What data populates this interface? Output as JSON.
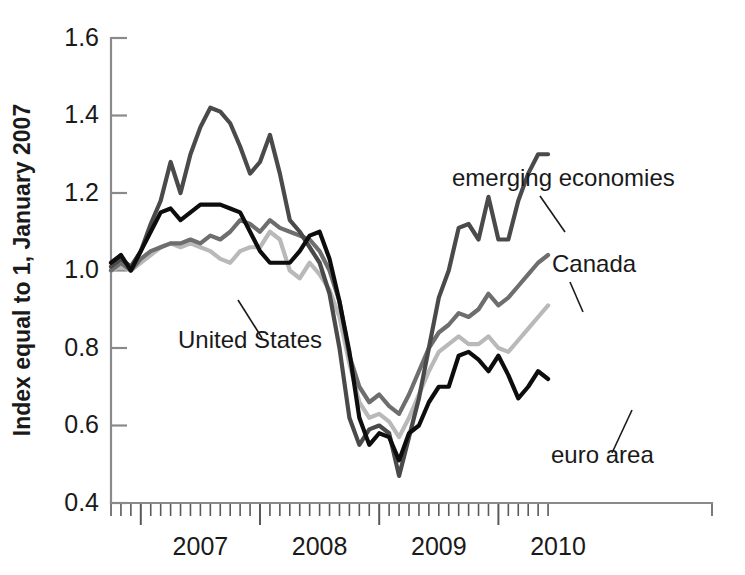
{
  "chart_data": {
    "type": "line",
    "title": "",
    "subtitle": "",
    "xlabel": "",
    "ylabel": "Index equal to 1, January 2007",
    "ylim": [
      0.4,
      1.6
    ],
    "yticks": [
      0.4,
      0.6,
      0.8,
      1.0,
      1.2,
      1.4,
      1.6
    ],
    "ytick_labels": [
      "0.4",
      "0.6",
      "0.8",
      "1.0",
      "1.2",
      "1.4",
      "1.6"
    ],
    "xlim": [
      "2006-10",
      "2010-07"
    ],
    "xticks": [
      "2007",
      "2008",
      "2009",
      "2010"
    ],
    "xtick_labels": [
      "2007",
      "2008",
      "2009",
      "2010"
    ],
    "x_minor_ticks": "monthly",
    "grid": false,
    "legend_position": "inline-annotations",
    "x": [
      "2006-10",
      "2006-11",
      "2006-12",
      "2007-01",
      "2007-02",
      "2007-03",
      "2007-04",
      "2007-05",
      "2007-06",
      "2007-07",
      "2007-08",
      "2007-09",
      "2007-10",
      "2007-11",
      "2007-12",
      "2008-01",
      "2008-02",
      "2008-03",
      "2008-04",
      "2008-05",
      "2008-06",
      "2008-07",
      "2008-08",
      "2008-09",
      "2008-10",
      "2008-11",
      "2008-12",
      "2009-01",
      "2009-02",
      "2009-03",
      "2009-04",
      "2009-05",
      "2009-06",
      "2009-07",
      "2009-08",
      "2009-09",
      "2009-10",
      "2009-11",
      "2009-12",
      "2010-01",
      "2010-02",
      "2010-03",
      "2010-04",
      "2010-05",
      "2010-06"
    ],
    "series": [
      {
        "name": "emerging economies",
        "color": "#4a4a4a",
        "label_position": {
          "x": 452,
          "y": 186
        },
        "leader": [
          [
            540,
            196
          ],
          [
            565,
            232
          ]
        ],
        "values": [
          1.01,
          1.03,
          1.01,
          1.05,
          1.12,
          1.18,
          1.28,
          1.2,
          1.3,
          1.37,
          1.42,
          1.41,
          1.38,
          1.32,
          1.25,
          1.28,
          1.35,
          1.25,
          1.13,
          1.1,
          1.06,
          1.02,
          0.94,
          0.8,
          0.62,
          0.55,
          0.59,
          0.6,
          0.58,
          0.47,
          0.57,
          0.67,
          0.8,
          0.93,
          1.0,
          1.11,
          1.12,
          1.08,
          1.19,
          1.08,
          1.08,
          1.18,
          1.25,
          1.3,
          1.3
        ]
      },
      {
        "name": "Canada",
        "color": "#6e6e6e",
        "label_position": {
          "x": 552,
          "y": 272
        },
        "leader": [
          [
            570,
            282
          ],
          [
            583,
            312
          ]
        ],
        "values": [
          1.0,
          1.02,
          1.0,
          1.03,
          1.05,
          1.06,
          1.07,
          1.07,
          1.08,
          1.07,
          1.09,
          1.08,
          1.1,
          1.13,
          1.12,
          1.1,
          1.13,
          1.11,
          1.1,
          1.09,
          1.08,
          1.05,
          1.0,
          0.92,
          0.78,
          0.7,
          0.66,
          0.68,
          0.65,
          0.63,
          0.68,
          0.74,
          0.8,
          0.84,
          0.86,
          0.89,
          0.88,
          0.9,
          0.94,
          0.91,
          0.93,
          0.96,
          0.99,
          1.02,
          1.04
        ]
      },
      {
        "name": "United States",
        "color": "#b9b9b9",
        "label_position": {
          "x": 178,
          "y": 348
        },
        "leader": [
          [
            262,
            338
          ],
          [
            238,
            300
          ]
        ],
        "values": [
          1.0,
          1.01,
          1.0,
          1.02,
          1.04,
          1.06,
          1.07,
          1.06,
          1.07,
          1.06,
          1.05,
          1.03,
          1.02,
          1.05,
          1.06,
          1.06,
          1.1,
          1.08,
          1.0,
          0.98,
          1.02,
          0.99,
          0.95,
          0.88,
          0.76,
          0.66,
          0.62,
          0.63,
          0.61,
          0.57,
          0.62,
          0.68,
          0.74,
          0.79,
          0.81,
          0.83,
          0.81,
          0.81,
          0.83,
          0.8,
          0.79,
          0.82,
          0.85,
          0.88,
          0.91
        ]
      },
      {
        "name": "euro area",
        "color": "#0d0d0d",
        "label_position": {
          "x": 551,
          "y": 463
        },
        "leader": [
          [
            612,
            453
          ],
          [
            632,
            410
          ]
        ],
        "values": [
          1.02,
          1.04,
          1.0,
          1.05,
          1.1,
          1.15,
          1.16,
          1.13,
          1.15,
          1.17,
          1.17,
          1.17,
          1.16,
          1.15,
          1.1,
          1.05,
          1.02,
          1.02,
          1.02,
          1.05,
          1.09,
          1.1,
          1.03,
          0.92,
          0.79,
          0.62,
          0.55,
          0.58,
          0.57,
          0.51,
          0.58,
          0.6,
          0.66,
          0.7,
          0.7,
          0.78,
          0.79,
          0.77,
          0.74,
          0.78,
          0.73,
          0.67,
          0.7,
          0.74,
          0.72
        ]
      }
    ]
  },
  "axes": {
    "y_title": "Index equal to 1, January 2007"
  }
}
